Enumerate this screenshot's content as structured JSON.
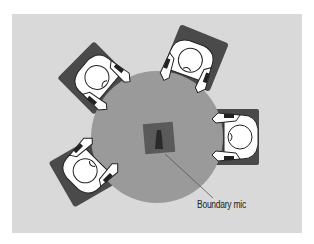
{
  "diagram": {
    "colors": {
      "background_panel": "#d9d9d9",
      "table": "#9a9a9a",
      "chair": "#4a4a4a",
      "person": "#ffffff",
      "mic_pad": "#5a5a5a",
      "mic": "#2a2a2a"
    },
    "elements": {
      "table": {
        "shape": "circle",
        "label": ""
      },
      "people": [
        {
          "position": "upper-left",
          "icon": "person-seated-icon"
        },
        {
          "position": "top-right",
          "icon": "person-seated-icon"
        },
        {
          "position": "right",
          "icon": "person-seated-icon"
        },
        {
          "position": "lower-left",
          "icon": "person-seated-icon"
        }
      ],
      "microphone": {
        "label": "Boundary mic"
      }
    }
  }
}
